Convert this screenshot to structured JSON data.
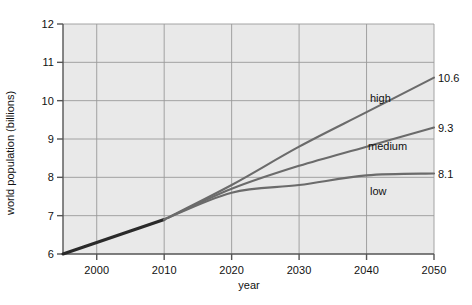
{
  "chart_data": {
    "type": "line",
    "title": "",
    "xlabel": "year",
    "ylabel": "world population (billions)",
    "xlim": [
      1995,
      2050
    ],
    "ylim": [
      6,
      12
    ],
    "xticks": [
      "2000",
      "2010",
      "2020",
      "2030",
      "2040",
      "2050"
    ],
    "xtick_values": [
      2000,
      2010,
      2020,
      2030,
      2040,
      2050
    ],
    "yticks": [
      "6",
      "7",
      "8",
      "9",
      "10",
      "11",
      "12"
    ],
    "ytick_values": [
      6,
      7,
      8,
      9,
      10,
      11,
      12
    ],
    "grid": true,
    "legend_position": "inline-right",
    "x": [
      1995,
      2000,
      2005,
      2010,
      2020,
      2030,
      2040,
      2050
    ],
    "series": [
      {
        "name": "historical",
        "label": "",
        "end_value_label": "",
        "color": "#2a2a2a",
        "values": [
          6.0,
          6.3,
          6.6,
          6.9,
          null,
          null,
          null,
          null
        ]
      },
      {
        "name": "high",
        "label": "high",
        "end_value_label": "10.6",
        "color": "#6b6b6b",
        "values": [
          null,
          null,
          null,
          6.9,
          7.8,
          8.8,
          9.7,
          10.6
        ]
      },
      {
        "name": "medium",
        "label": "medium",
        "end_value_label": "9.3",
        "color": "#6b6b6b",
        "values": [
          null,
          null,
          null,
          6.9,
          7.7,
          8.3,
          8.8,
          9.3
        ]
      },
      {
        "name": "low",
        "label": "low",
        "end_value_label": "8.1",
        "color": "#6b6b6b",
        "values": [
          null,
          null,
          null,
          6.9,
          7.6,
          7.8,
          8.05,
          8.1
        ]
      }
    ],
    "plot_background": "#e9e9e9",
    "grid_color": "#9a9a9a",
    "axis_color": "#555555"
  }
}
